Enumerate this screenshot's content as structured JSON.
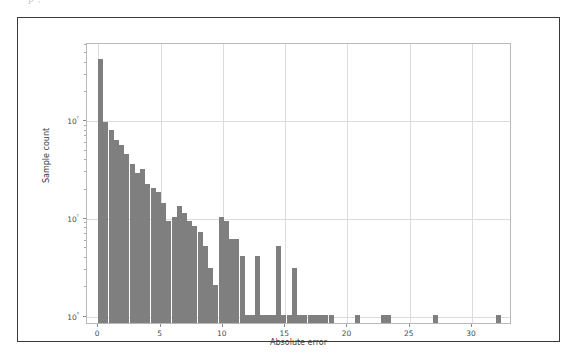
{
  "document_sliver": "p                                                  ,",
  "chart_data": {
    "type": "bar",
    "title": "",
    "subtitle": "",
    "xlabel": "Absolute error",
    "ylabel": "Sample count",
    "yscale": "log",
    "xscale": "linear",
    "xlim": [
      -0.9,
      33.2
    ],
    "ylim": [
      0.82,
      620
    ],
    "grid": true,
    "legend": null,
    "bar_color": "#7f7f7f",
    "xticks": [
      0,
      5,
      10,
      15,
      20,
      25,
      30
    ],
    "xticklabels": [
      "0",
      "5",
      "10",
      "15",
      "20",
      "25",
      "30"
    ],
    "yticks": [
      1,
      10,
      100
    ],
    "yticklabels": [
      "10⁰",
      "10¹",
      "10²"
    ],
    "bin_width": 0.42,
    "categories": [
      0.0,
      0.42,
      0.84,
      1.26,
      1.68,
      2.1,
      2.52,
      2.94,
      3.36,
      3.78,
      4.2,
      4.62,
      5.04,
      5.46,
      5.88,
      6.3,
      6.72,
      7.14,
      7.56,
      7.98,
      8.4,
      8.82,
      9.24,
      9.66,
      10.08,
      10.5,
      10.92,
      11.34,
      11.76,
      12.18,
      12.6,
      13.02,
      13.44,
      13.86,
      14.28,
      14.7,
      15.12,
      15.54,
      15.96,
      16.38,
      16.8,
      17.22,
      17.64,
      18.06,
      18.48,
      20.58,
      22.68,
      23.1,
      26.88,
      31.92
    ],
    "values": [
      420,
      95,
      78,
      62,
      55,
      44,
      35,
      28,
      31,
      22,
      20,
      18,
      14,
      9,
      10,
      13,
      11,
      9,
      8,
      7,
      5,
      3,
      2,
      10,
      9,
      6,
      6,
      4,
      1,
      1,
      4,
      1,
      1,
      1,
      5,
      1,
      1,
      3,
      1,
      1,
      1,
      1,
      1,
      1,
      1,
      1,
      1,
      1,
      1,
      1
    ]
  }
}
